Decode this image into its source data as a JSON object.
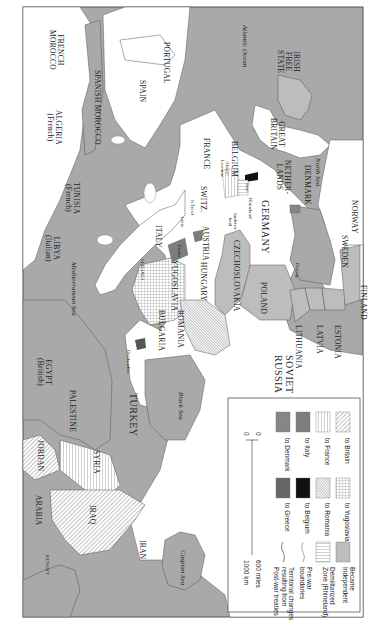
{
  "map": {
    "orientation": "rotated 90 degrees clockwise (north to the right)",
    "colors": {
      "sea": "#a9a9a9",
      "land": "#ffffff",
      "independent": "#bdbdbd",
      "to_italy": "#7d7d7d",
      "to_denmark": "#8a8a8a",
      "to_greece": "#666666",
      "to_belgium": "#111111",
      "border": "#555555"
    },
    "labels": {
      "french_morocco": "FRENCH\nMOROCCO",
      "portugal": "PORTUGAL",
      "spanish_morocco": "SPANISH MOROCCO",
      "spain": "SPAIN",
      "algeria": "ALGERIA\n(French)",
      "atlantic": "Atlantic Ocean",
      "irish_free_state": "IRISH\nFREE\nSTATE",
      "great_britain": "GREAT\nBRITAIN",
      "france": "FRANCE",
      "belgium": "BELGIUM",
      "alsace_lorraine": "Alsace-\nLorraine",
      "netherlands": "NETHER-\nLANDS",
      "north_sea": "North Sea",
      "denmark": "DENMARK",
      "norway": "NORWAY",
      "sweden": "SWEDEN",
      "finland": "FINLAND",
      "germany": "GERMANY",
      "rhineland": "Rhineland",
      "saar": "Saar",
      "sudetenland": "Sudeten-\nland",
      "switz": "SWITZ.",
      "s_tyrol": "S.Tyrol",
      "istria": "Istria",
      "fiume": "Fiume",
      "austria": "AUSTRIA",
      "czechoslovakia": "CZECHOSLOVAKIA",
      "danzig": "Danzig",
      "poland": "POLAND",
      "hungary": "HUNGARY",
      "tunisia": "TUNISIA\n(French)",
      "italy": "ITALY",
      "yugoslavia": "YUGOSLAVIA",
      "albania": "ALBANIA",
      "romania": "ROMANIA",
      "bulgaria": "BULGARIA",
      "libya": "LIBYA\n(Italian)",
      "mediterranean": "Mediterranean Sea",
      "lithuania": "LITHUANIA",
      "latvia": "LATVIA",
      "estonia": "ESTONIA",
      "soviet_russia": "SOVIET\nRUSSIA",
      "egypt": "EGYPT\n(British)",
      "dardanelles": "Dardanelles",
      "palestine": "PALESTINE",
      "turkey": "TURKEY",
      "black_sea": "Black Sea",
      "jordan": "JORDAN",
      "syria": "SYRIA",
      "arabia": "ARABIA",
      "iraq": "IRAQ",
      "kuwait": "KUWAIT",
      "iran": "IRAN",
      "caspian": "Caspian Sea"
    }
  },
  "legend": {
    "items": [
      {
        "label": "to Britain",
        "pattern": "diag-lines"
      },
      {
        "label": "to France",
        "pattern": "vert-lines"
      },
      {
        "label": "to Italy",
        "pattern": "solid-mid-gray"
      },
      {
        "label": "to Denmark",
        "pattern": "solid-gray-lined"
      },
      {
        "label": "to Yugoslavia",
        "pattern": "grid"
      },
      {
        "label": "to Romania",
        "pattern": "diag-dense"
      },
      {
        "label": "to Belgium",
        "pattern": "solid-black"
      },
      {
        "label": "to Greece",
        "pattern": "solid-dark-gray"
      },
      {
        "label": "Became\nIndependent",
        "pattern": "solid-light-gray"
      },
      {
        "label": "Demilitarized\nZone (Rhineland)",
        "pattern": "horiz-lines"
      },
      {
        "label": "Pre-war\nboundaries",
        "pattern": "line-thin"
      },
      {
        "label": "Territorial changes\nresulting from\nPost-war treaties",
        "pattern": "line-thick"
      }
    ],
    "scale": {
      "zero_top": "0",
      "zero_bottom": "0",
      "miles": "600 miles",
      "km": "1000 km"
    }
  }
}
